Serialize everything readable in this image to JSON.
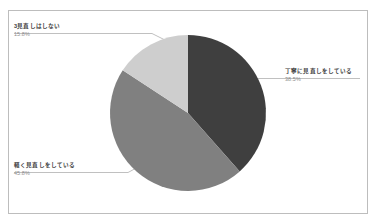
{
  "chart_data": {
    "type": "pie",
    "title": "",
    "xlabel": "",
    "ylabel": "",
    "legend_position": "none",
    "grid": false,
    "labels_outside": true,
    "categories": [
      "丁寧に見直しをしている",
      "軽く見直しをしている",
      "見直しはしない"
    ],
    "values": [
      38.5,
      45.8,
      15.8
    ],
    "value_suffix": "%",
    "start_angle_deg": 0,
    "direction": "clockwise",
    "slices": [
      {
        "label": "丁寧に見直しをしている",
        "value": 38.5,
        "value_text": "38.5%",
        "color": "#3f3f3f",
        "start_deg": 0,
        "end_deg": 138.6,
        "label_side": "right"
      },
      {
        "label": "軽く見直しをしている",
        "value": 45.8,
        "value_text": "45.8%",
        "color": "#808080",
        "start_deg": 138.6,
        "end_deg": 303.5,
        "label_side": "left-bottom"
      },
      {
        "label": "3見直しはしない",
        "value": 15.8,
        "value_text": "15.8%",
        "color": "#cecece",
        "start_deg": 303.5,
        "end_deg": 360,
        "label_side": "left-top"
      }
    ]
  },
  "figure": {
    "frame_color": "#bdbdbd",
    "background": "#ffffff",
    "leader_line_color": "#b0b0b0",
    "title_text": ""
  },
  "labels": {
    "nashi": {
      "title": "3見直しはしない",
      "value": "15.8%"
    },
    "karuku": {
      "title": "軽く見直しをしている",
      "value": "45.8%"
    },
    "teinei": {
      "title": "丁寧に見直しをしている",
      "value": "38.5%"
    }
  }
}
